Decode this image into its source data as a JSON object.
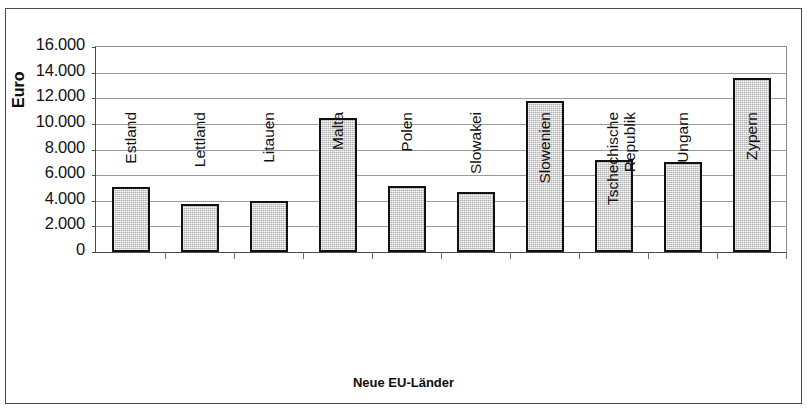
{
  "chart_data": {
    "type": "bar",
    "title": "",
    "xlabel": "Neue EU-Länder",
    "ylabel": "Euro",
    "categories": [
      "Estland",
      "Lettland",
      "Litauen",
      "Malta",
      "Polen",
      "Slowakei",
      "Slowenien",
      "Tschechische Republik",
      "Ungarn",
      "Zypern"
    ],
    "category_lines": [
      [
        "Estland"
      ],
      [
        "Lettland"
      ],
      [
        "Litauen"
      ],
      [
        "Malta"
      ],
      [
        "Polen"
      ],
      [
        "Slowakei"
      ],
      [
        "Slowenien"
      ],
      [
        "Tschechische",
        "Republik"
      ],
      [
        "Ungarn"
      ],
      [
        "Zypern"
      ]
    ],
    "values": [
      5100,
      3750,
      3950,
      10450,
      5150,
      4650,
      11800,
      7150,
      7050,
      13550
    ],
    "ylim": [
      0,
      16000
    ],
    "ytick_values": [
      0,
      2000,
      4000,
      6000,
      8000,
      10000,
      12000,
      14000,
      16000
    ],
    "ytick_labels": [
      "0",
      "2.000",
      "4.000",
      "6.000",
      "8.000",
      "10.000",
      "12.000",
      "14.000",
      "16.000"
    ],
    "grid": true,
    "legend": "none",
    "bar_fill_color": "#cfcfcf",
    "bar_border_color": "#111111",
    "gridline_color": "#9a9a9a",
    "axis_color": "#4a4a4a",
    "plot_background": "#ffffff"
  }
}
